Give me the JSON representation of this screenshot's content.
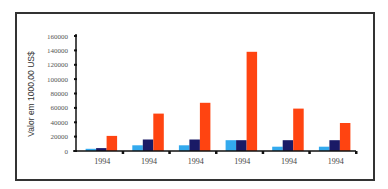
{
  "chart_data": {
    "type": "bar",
    "title": "",
    "xlabel": "",
    "ylabel": "Valor em 1000,00 US$",
    "ylim": [
      0,
      160000
    ],
    "yticks": [
      0,
      20000,
      40000,
      60000,
      80000,
      100000,
      120000,
      140000,
      160000
    ],
    "ytick_labels": [
      "0",
      "20000",
      "40000",
      "60000",
      "80000",
      "100000",
      "120000",
      "140000",
      "160000"
    ],
    "categories": [
      "1994",
      "1994",
      "1994",
      "1994",
      "1994",
      "1994"
    ],
    "series": [
      {
        "name": "Series 1",
        "color": "#33aaee",
        "values": [
          3000,
          8000,
          8000,
          15000,
          6000,
          6000
        ]
      },
      {
        "name": "Series 2",
        "color": "#1a1a66",
        "values": [
          4000,
          16000,
          16000,
          15000,
          15000,
          15000
        ]
      },
      {
        "name": "Series 3",
        "color": "#ff4411",
        "values": [
          21000,
          52000,
          67000,
          138000,
          59000,
          39000
        ]
      }
    ],
    "grid": false,
    "legend": "none"
  }
}
